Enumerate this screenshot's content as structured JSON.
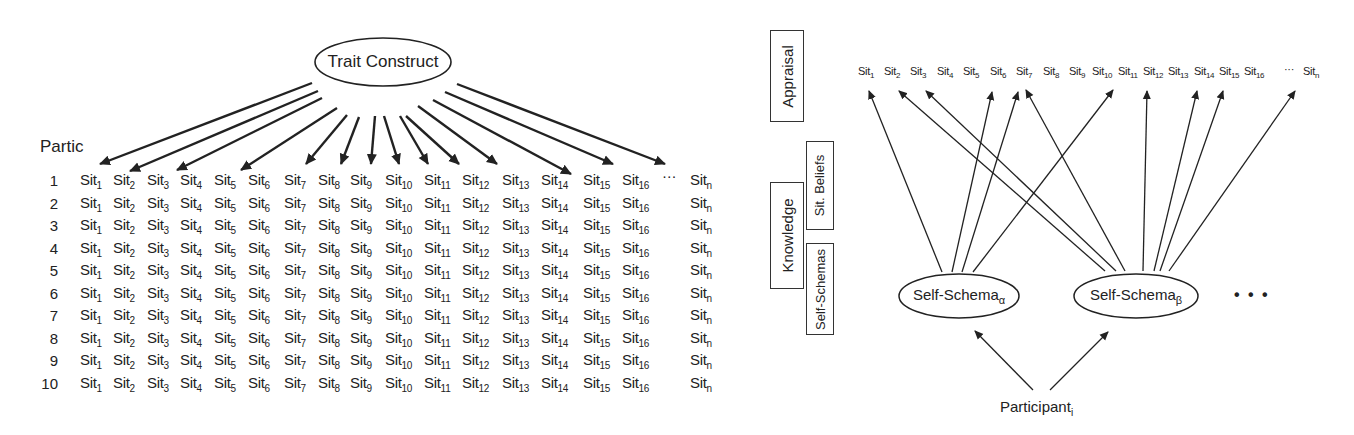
{
  "left_diagram": {
    "root_label": "Trait Construct",
    "row_header": "Partic",
    "columns": [
      {
        "base": "Sit",
        "sub": "1"
      },
      {
        "base": "Sit",
        "sub": "2"
      },
      {
        "base": "Sit",
        "sub": "3"
      },
      {
        "base": "Sit",
        "sub": "4"
      },
      {
        "base": "Sit",
        "sub": "5"
      },
      {
        "base": "Sit",
        "sub": "6"
      },
      {
        "base": "Sit",
        "sub": "7"
      },
      {
        "base": "Sit",
        "sub": "8"
      },
      {
        "base": "Sit",
        "sub": "9"
      },
      {
        "base": "Sit",
        "sub": "10"
      },
      {
        "base": "Sit",
        "sub": "11"
      },
      {
        "base": "Sit",
        "sub": "12"
      },
      {
        "base": "Sit",
        "sub": "13"
      },
      {
        "base": "Sit",
        "sub": "14"
      },
      {
        "base": "Sit",
        "sub": "15"
      },
      {
        "base": "Sit",
        "sub": "16"
      },
      {
        "base": "Sit",
        "sub": "n"
      }
    ],
    "ellipsis": "···",
    "rows": [
      "1",
      "2",
      "3",
      "4",
      "5",
      "6",
      "7",
      "8",
      "9",
      "10"
    ],
    "arrow_targets": [
      "Sit1",
      "Sit2",
      "Sit4",
      "Sit6",
      "Sit7",
      "Sit8",
      "Sit9",
      "Sit10",
      "Sit11",
      "Sit12",
      "Sit13",
      "Sit14",
      "Sit15",
      "Sitn"
    ]
  },
  "right_diagram": {
    "side_labels": {
      "appraisal": "Appraisal",
      "knowledge": "Knowledge",
      "sit_beliefs": "Sit. Beliefs",
      "self_schemas": "Self-Schemas"
    },
    "situations": [
      {
        "base": "Sit",
        "sub": "1"
      },
      {
        "base": "Sit",
        "sub": "2"
      },
      {
        "base": "Sit",
        "sub": "3"
      },
      {
        "base": "Sit",
        "sub": "4"
      },
      {
        "base": "Sit",
        "sub": "5"
      },
      {
        "base": "Sit",
        "sub": "6"
      },
      {
        "base": "Sit",
        "sub": "7"
      },
      {
        "base": "Sit",
        "sub": "8"
      },
      {
        "base": "Sit",
        "sub": "9"
      },
      {
        "base": "Sit",
        "sub": "10"
      },
      {
        "base": "Sit",
        "sub": "11"
      },
      {
        "base": "Sit",
        "sub": "12"
      },
      {
        "base": "Sit",
        "sub": "13"
      },
      {
        "base": "Sit",
        "sub": "14"
      },
      {
        "base": "Sit",
        "sub": "15"
      },
      {
        "base": "Sit",
        "sub": "16"
      }
    ],
    "situations_ellipsis": "···",
    "situation_last": {
      "base": "Sit",
      "sub": "n"
    },
    "schema_alpha": {
      "base": "Self-Schema",
      "sub": "α",
      "targets": [
        "Sit1",
        "Sit5",
        "Sit6",
        "Sit10"
      ]
    },
    "schema_beta": {
      "base": "Self-Schema",
      "sub": "β",
      "targets": [
        "Sit2",
        "Sit3",
        "Sit7",
        "Sit11",
        "Sit13",
        "Sit14",
        "Sitn"
      ]
    },
    "more_schemas": "• • •",
    "participant": {
      "base": "Participant",
      "sub": "i"
    }
  }
}
